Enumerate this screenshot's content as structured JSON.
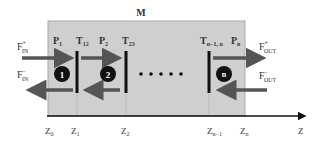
{
  "diagram": {
    "region_label": "M",
    "colors": {
      "region_fill": "#cfcfcf",
      "region_border": "#a8a8a8",
      "arrow": "#555555",
      "barrier": "#111111",
      "circle": "#111111",
      "circle_text": "#ffffff",
      "axis": "#111111"
    },
    "incoming": {
      "forward": {
        "base": "F",
        "sup": "+",
        "sub": "IN"
      },
      "backward": {
        "base": "F",
        "sup": "−",
        "sub": "IN"
      }
    },
    "outgoing": {
      "forward": {
        "base": "F",
        "sup": "+",
        "sub": "OUT"
      },
      "backward": {
        "base": "F",
        "sup": "−",
        "sub": "OUT"
      }
    },
    "layer_labels": [
      {
        "base": "P",
        "sub": "1"
      },
      {
        "base": "T",
        "sub": "12"
      },
      {
        "base": "P",
        "sub": "2"
      },
      {
        "base": "T",
        "sub": "23"
      },
      {
        "base": "T",
        "sub": "n−1, n"
      },
      {
        "base": "P",
        "sub": "n"
      }
    ],
    "circles": [
      "1",
      "2",
      "n"
    ],
    "ellipsis": "• • • • •",
    "axis": {
      "label": "Z",
      "ticks": [
        {
          "base": "Z",
          "sub": "0"
        },
        {
          "base": "Z",
          "sub": "1"
        },
        {
          "base": "Z",
          "sub": "2"
        },
        {
          "base": "Z",
          "sub": "n−1"
        },
        {
          "base": "Z",
          "sub": "n"
        }
      ]
    }
  }
}
